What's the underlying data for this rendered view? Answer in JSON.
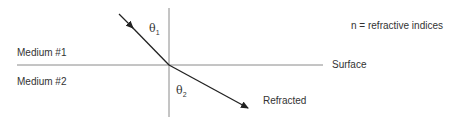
{
  "diagram": {
    "legend": "n = refractive indices",
    "medium_top": "Medium #1",
    "medium_bottom": "Medium #2",
    "surface_label": "Surface",
    "refracted_label": "Refracted",
    "theta1": {
      "symbol": "θ",
      "subscript": "1"
    },
    "theta2": {
      "symbol": "θ",
      "subscript": "2"
    },
    "colors": {
      "lines": "#8a8a8a",
      "rays": "#222222",
      "text": "#333333"
    }
  }
}
